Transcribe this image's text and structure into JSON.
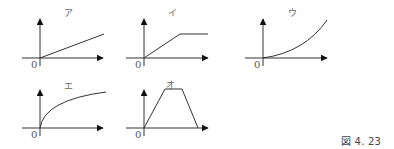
{
  "figure": {
    "caption": "図 4. 23",
    "graphs": [
      {
        "id": "a",
        "label": "ア",
        "zero": "0",
        "shape": "linear-increasing"
      },
      {
        "id": "i",
        "label": "イ",
        "zero": "0",
        "shape": "linear-then-constant"
      },
      {
        "id": "u",
        "label": "ウ",
        "zero": "0",
        "shape": "convex-increasing"
      },
      {
        "id": "e",
        "label": "エ",
        "zero": "0",
        "shape": "concave-increasing"
      },
      {
        "id": "o",
        "label": "オ",
        "zero": "0",
        "shape": "trapezoid"
      }
    ]
  },
  "colors": {
    "line": "#333333",
    "label": "#666666"
  }
}
